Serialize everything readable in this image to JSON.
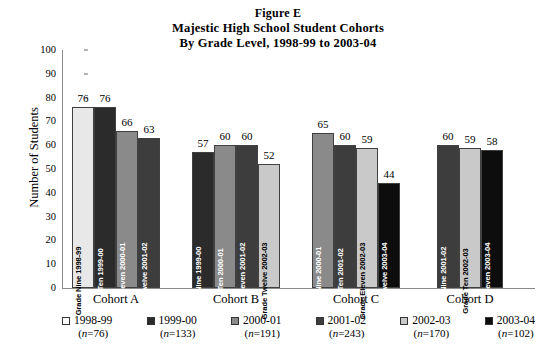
{
  "title": {
    "line1": "Figure E",
    "line2": "Majestic High School Student Cohorts",
    "line3": "By Grade Level, 1998-99 to 2003-04"
  },
  "chart_data": {
    "type": "bar",
    "xlabel": "",
    "ylabel": "Number of Students",
    "ylim": [
      0,
      100
    ],
    "ytick_step": 10,
    "yticks": [
      "100",
      "90",
      "80",
      "70",
      "60",
      "50",
      "40",
      "30",
      "20",
      "10",
      "0"
    ],
    "grid": false,
    "legend_position": "bottom",
    "categories": [
      "Cohort A",
      "Cohort B",
      "Cohort C",
      "Cohort D"
    ],
    "groups": [
      {
        "label": "Cohort A",
        "bars": [
          {
            "value": 76,
            "caption": "Grade Nine 1998-99",
            "series": "1998-99",
            "color": "#e8e8e8",
            "caption_color": "dark"
          },
          {
            "value": 76,
            "caption": "Grade Ten 1999-00",
            "series": "1999-00",
            "color": "#2b2b2b",
            "caption_color": "light"
          },
          {
            "value": 66,
            "caption": "Grade Eleven 2000-01",
            "series": "2000-01",
            "color": "#8a8a8a",
            "caption_color": "light"
          },
          {
            "value": 63,
            "caption": "Grade Twelve 2001-02",
            "series": "2001-02",
            "color": "#3d3d3d",
            "caption_color": "light"
          }
        ]
      },
      {
        "label": "Cohort B",
        "bars": [
          {
            "value": 57,
            "caption": "Grade Nine 1999-00",
            "series": "1999-00",
            "color": "#2b2b2b",
            "caption_color": "light"
          },
          {
            "value": 60,
            "caption": "Grade Ten 2000-01",
            "series": "2000-01",
            "color": "#8a8a8a",
            "caption_color": "light"
          },
          {
            "value": 60,
            "caption": "Grade Eleven 2001-02",
            "series": "2001-02",
            "color": "#3d3d3d",
            "caption_color": "light"
          },
          {
            "value": 52,
            "caption": "Grade Twelve 2002-03",
            "series": "2002-03",
            "color": "#c9c9c9",
            "caption_color": "dark"
          }
        ]
      },
      {
        "label": "Cohort C",
        "bars": [
          {
            "value": 65,
            "caption": "Grade Nine 2000-01",
            "series": "2000-01",
            "color": "#8a8a8a",
            "caption_color": "light"
          },
          {
            "value": 60,
            "caption": "Grade Ten 2001-02",
            "series": "2001-02",
            "color": "#3d3d3d",
            "caption_color": "light"
          },
          {
            "value": 59,
            "caption": "Grade Eleven 2002-03",
            "series": "2002-03",
            "color": "#c9c9c9",
            "caption_color": "dark"
          },
          {
            "value": 44,
            "caption": "Grade Twelve 2003-04",
            "series": "2003-04",
            "color": "#0d0d0d",
            "caption_color": "light"
          }
        ]
      },
      {
        "label": "Cohort D",
        "bars": [
          {
            "value": 60,
            "caption": "Grade Nine 2001-02",
            "series": "2001-02",
            "color": "#3d3d3d",
            "caption_color": "light"
          },
          {
            "value": 59,
            "caption": "Grade Ten 2002-03",
            "series": "2002-03",
            "color": "#c9c9c9",
            "caption_color": "dark"
          },
          {
            "value": 58,
            "caption": "Grade Eleven 2003-04",
            "series": "2003-04",
            "color": "#0d0d0d",
            "caption_color": "light"
          }
        ]
      }
    ],
    "legend": [
      {
        "label": "1998-99",
        "n": "(n=76)",
        "color": "#ffffff"
      },
      {
        "label": "1999-00",
        "n": "(n=133)",
        "color": "#2b2b2b"
      },
      {
        "label": "2000-01",
        "n": "(n=191)",
        "color": "#8a8a8a"
      },
      {
        "label": "2001-02",
        "n": "(n=243)",
        "color": "#3d3d3d"
      },
      {
        "label": "2002-03",
        "n": "(n=170)",
        "color": "#c9c9c9"
      },
      {
        "label": "2003-04",
        "n": "(n=102)",
        "color": "#0d0d0d"
      }
    ]
  }
}
